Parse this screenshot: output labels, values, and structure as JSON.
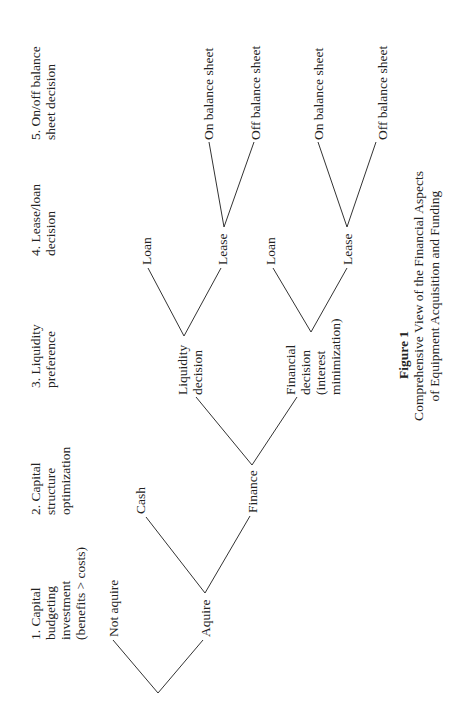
{
  "figure": {
    "orientation": "rotated-90-ccw",
    "headers": [
      {
        "lines": [
          "1. Capital",
          "budgeting",
          "investment",
          "(benefits > costs)"
        ]
      },
      {
        "lines": [
          "2. Capital",
          "structure",
          "optimization"
        ]
      },
      {
        "lines": [
          "3. Liquidity",
          "preference"
        ]
      },
      {
        "lines": [
          "4. Lease/loan",
          "decision"
        ]
      },
      {
        "lines": [
          "5. On/off balance",
          "sheet decision"
        ]
      }
    ],
    "nodes": {
      "not_aquire": "Not aquire",
      "aquire": "Aquire",
      "cash": "Cash",
      "finance": "Finance",
      "liquidity_decision": [
        "Liquidity",
        "decision"
      ],
      "financial_decision": [
        "Financial",
        "decision",
        "(interest",
        "minimization)"
      ],
      "loan_1": "Loan",
      "lease_1": "Lease",
      "loan_2": "Loan",
      "lease_2": "Lease",
      "on_balance_1": "On balance sheet",
      "off_balance_1": "Off balance sheet",
      "on_balance_2": "On balance sheet",
      "off_balance_2": "Off balance sheet"
    },
    "caption": {
      "label": "Figure 1",
      "lines": [
        "Comprehensive View of the Financial Aspects",
        "of Equipment Acquisition and Funding"
      ]
    }
  }
}
